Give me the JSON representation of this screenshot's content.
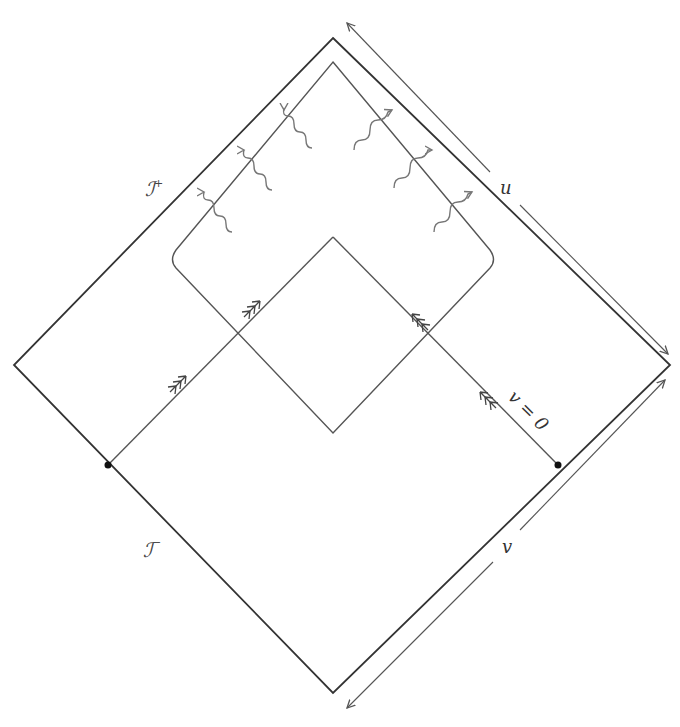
{
  "diagram": {
    "type": "penrose-diagram",
    "labels": {
      "scri_plus": "ℐ",
      "scri_plus_sup": "+",
      "scri_minus": "ℐ",
      "scri_minus_sup": "−",
      "u_axis": "u",
      "v_axis": "v",
      "v_zero": "v = 0"
    },
    "outer_diamond": {
      "top": [
        333,
        38
      ],
      "right": [
        670,
        365
      ],
      "bottom": [
        333,
        693
      ],
      "left": [
        14,
        365
      ]
    },
    "inner_region": {
      "top": [
        333,
        62
      ],
      "right": [
        497,
        258
      ],
      "bottom": [
        333,
        433
      ],
      "left": [
        170,
        258
      ]
    },
    "inner_diamond_top": [
      333,
      237
    ],
    "points": [
      [
        108,
        465
      ],
      [
        558,
        465
      ]
    ],
    "outgoing_wavy_rays": 6,
    "colors": {
      "outer": "#333333",
      "inner": "#555555",
      "wave": "#777777"
    }
  }
}
